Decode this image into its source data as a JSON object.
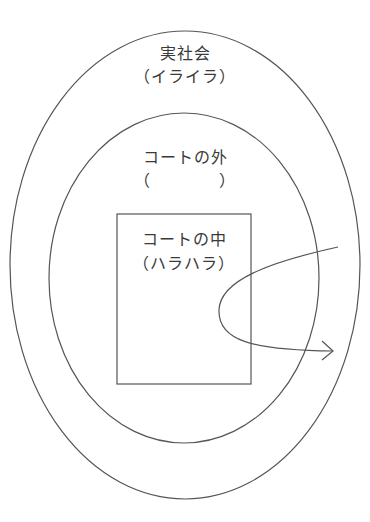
{
  "diagram": {
    "stroke_color": "#555555",
    "outer_region": {
      "title": "実社会",
      "subtitle": "（イライラ）"
    },
    "middle_region": {
      "title": "コートの外",
      "subtitle": "（　　　　）"
    },
    "inner_region": {
      "title": "コートの中",
      "subtitle": "（ハラハラ）"
    },
    "arrow": {
      "description": "curved arrow looping from outer region into the court and back out"
    }
  }
}
